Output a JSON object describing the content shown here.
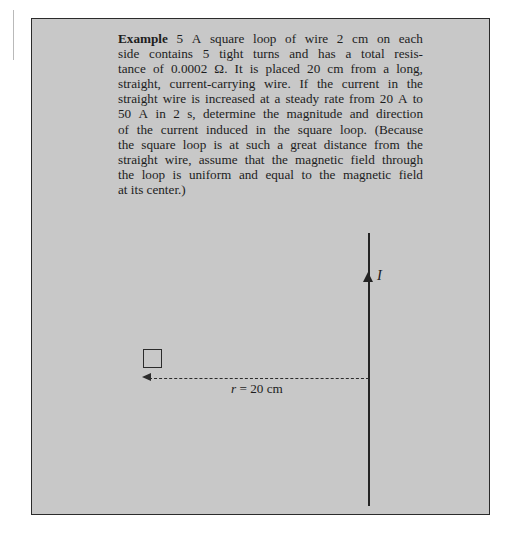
{
  "page": {
    "background_color": "#ffffff",
    "panel_background_color": "#c8c8c8",
    "panel_border_color": "#2b2b2b",
    "ink_color": "#1d1d1d"
  },
  "example": {
    "lead_label": "Example",
    "number": "5",
    "body_lines": [
      "A square loop of wire 2 cm on each",
      "side contains 5 tight turns and has a total resis-",
      "tance of 0.0002 Ω. It is placed 20 cm from a long,",
      "straight, current-carrying wire. If the current in the",
      "straight wire is increased at a steady rate from 20 A to",
      "50 A in 2 s, determine the magnitude and direction",
      "of the current induced in the square loop. (Because",
      "the square loop is at such a great distance from the",
      "straight wire, assume that the magnetic field through",
      "the loop is uniform and equal to the magnetic field",
      "at its center.)"
    ],
    "full_text": "Example 5 A square loop of wire 2 cm on each side contains 5 tight turns and has a total resistance of 0.0002 Ω. It is placed 20 cm from a long, straight, current-carrying wire. If the current in the straight wire is increased at a steady rate from 20 A to 50 A in 2 s, determine the magnitude and direction of the current induced in the square loop. (Because the square loop is at such a great distance from the straight wire, assume that the magnetic field through the loop is uniform and equal to the magnetic field at its center.)"
  },
  "diagram": {
    "current_label": "I",
    "distance_symbol": "r",
    "distance_equals": " = ",
    "distance_value": "20 cm",
    "distance_label_full": "r = 20 cm",
    "wire_description": "long-straight-current-carrying-wire",
    "loop_description": "square-loop-of-wire"
  }
}
